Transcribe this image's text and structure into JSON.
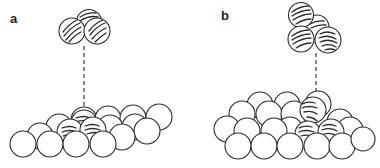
{
  "figure": {
    "panels": [
      {
        "id": "a",
        "label": "a",
        "description": "Dimer of hatched atoms above a flat close-packed surface; dashed line marks adsorption site on hatched surface atoms",
        "cluster_atoms": 3,
        "surface_type": "flat close-packed terrace"
      },
      {
        "id": "b",
        "label": "b",
        "description": "Tetramer of hatched atoms above a stepped/kinked surface; dashed line marks adsorption site at a step with hatched atoms",
        "cluster_atoms": 4,
        "surface_type": "stepped surface"
      }
    ],
    "colors": {
      "line": "#2a2a2a",
      "fill": "#ffffff",
      "background": "#ffffff"
    }
  }
}
